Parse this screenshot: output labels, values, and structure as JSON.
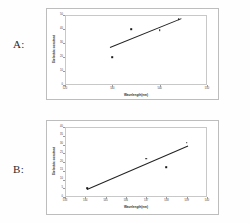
{
  "figure": {
    "background": "#ffffff",
    "panel_label_a": "A:",
    "panel_label_b": "B:"
  },
  "chart_data": [
    {
      "id": "chart-a",
      "type": "scatter",
      "title": "",
      "xlabel": "Wavelength(nm)",
      "ylabel": "Dielectric constant",
      "xlim": [
        520,
        550
      ],
      "ylim": [
        0,
        50
      ],
      "xticks": [
        520,
        530,
        540,
        550
      ],
      "xticklabels": [
        "520",
        "530",
        "540",
        "550"
      ],
      "yticks": [
        0,
        10,
        20,
        30,
        40,
        50
      ],
      "yticklabels": [
        "0",
        "10",
        "20",
        "30",
        "40",
        "50"
      ],
      "grid": false,
      "legend": "none",
      "points": [
        {
          "x": 530.0,
          "y": 20.0
        },
        {
          "x": 534.0,
          "y": 40.0
        },
        {
          "x": 540.0,
          "y": 39.0
        },
        {
          "x": 544.0,
          "y": 47.0
        }
      ],
      "trendline": {
        "x0": 529.5,
        "y0": 27.0,
        "x1": 544.5,
        "y1": 47.5
      }
    },
    {
      "id": "chart-b",
      "type": "scatter",
      "title": "",
      "xlabel": "Wavelength(nm)",
      "ylabel": "Dielectric constant",
      "xlim": [
        533,
        540
      ],
      "ylim": [
        0,
        40
      ],
      "xticks": [
        533,
        534,
        535,
        536,
        537,
        538,
        539,
        540
      ],
      "xticklabels": [
        "533",
        "534",
        "535",
        "536",
        "537",
        "538",
        "539",
        "540"
      ],
      "yticks": [
        0,
        5,
        10,
        15,
        20,
        25,
        30,
        35,
        40
      ],
      "yticklabels": [
        "0",
        "5",
        "10",
        "15",
        "20",
        "25",
        "30",
        "35",
        "40"
      ],
      "grid": false,
      "legend": "none",
      "points": [
        {
          "x": 534.1,
          "y": 5.0
        },
        {
          "x": 537.0,
          "y": 22.0
        },
        {
          "x": 538.0,
          "y": 17.0
        },
        {
          "x": 539.0,
          "y": 31.0
        }
      ],
      "trendline": {
        "x0": 534.1,
        "y0": 4.5,
        "x1": 539.1,
        "y1": 29.5
      }
    }
  ]
}
